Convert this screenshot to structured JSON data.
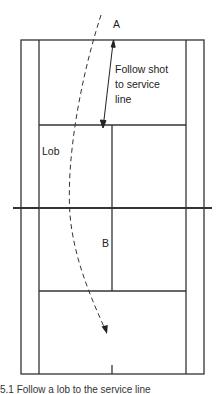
{
  "diagram": {
    "labels": {
      "point_a": "A",
      "point_b": "B",
      "lob": "Lob",
      "follow_line1": "Follow shot",
      "follow_line2": "to service",
      "follow_line3": "line"
    },
    "caption": "5.1   Follow a lob to the service line",
    "colors": {
      "court_line": "#333333",
      "background": "#ffffff",
      "text": "#222222"
    }
  }
}
